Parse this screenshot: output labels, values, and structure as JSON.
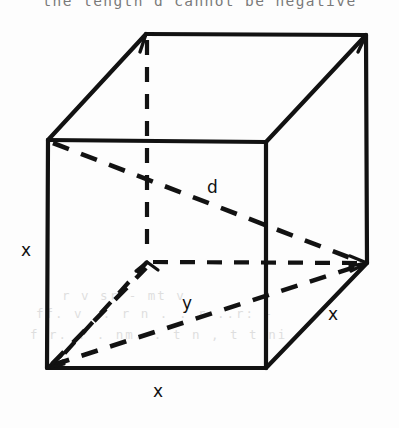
{
  "figure": {
    "caption": "the length d cannot be negative",
    "stroke_color": "#121212",
    "background_color": "#fdfdfd",
    "labels": {
      "space_diagonal": "d",
      "face_diagonal": "y",
      "edge_left": "x",
      "edge_bottom": "x",
      "edge_right": "x"
    },
    "geometry": {
      "front_top_left": [
        48,
        140
      ],
      "front_top_right": [
        266,
        142
      ],
      "front_bottom_left": [
        47,
        368
      ],
      "front_bottom_right": [
        266,
        368
      ],
      "back_top_left": [
        146,
        34
      ],
      "back_top_right": [
        366,
        35
      ],
      "back_bottom_left": [
        147,
        262
      ],
      "back_bottom_right": [
        367,
        263
      ],
      "solid_edges": [
        "front_top_left-front_top_right",
        "front_top_right-front_bottom_right",
        "front_bottom_right-front_bottom_left",
        "front_bottom_left-front_top_left",
        "front_top_left-back_top_left",
        "back_top_left-back_top_right",
        "back_top_right-front_top_right",
        "back_top_right-back_bottom_right",
        "back_bottom_right-front_bottom_right"
      ],
      "dashed_edges": [
        "back_top_left-back_bottom_left",
        "back_bottom_left-back_bottom_right",
        "back_bottom_left-front_bottom_left"
      ],
      "dashed_diagonals": [
        "front_top_left-back_bottom_right",
        "front_bottom_left-back_bottom_right",
        "front_bottom_left-back_top_left"
      ]
    },
    "label_positions": {
      "space_diagonal": [
        207,
        179
      ],
      "face_diagonal": [
        182,
        295
      ],
      "edge_left": [
        21,
        242
      ],
      "edge_bottom": [
        153,
        383
      ],
      "edge_right": [
        328,
        306
      ]
    },
    "bleed_through_rows": [
      {
        "text": "r  v  sr - mt  v",
        "left": 62,
        "top": 288
      },
      {
        "text": "ff.  v    ..  r n . .  r ..r: -",
        "left": 36,
        "top": 306
      },
      {
        "text": "f r.   . . nm.    . t n , t t  ni",
        "left": 30,
        "top": 327
      }
    ]
  }
}
